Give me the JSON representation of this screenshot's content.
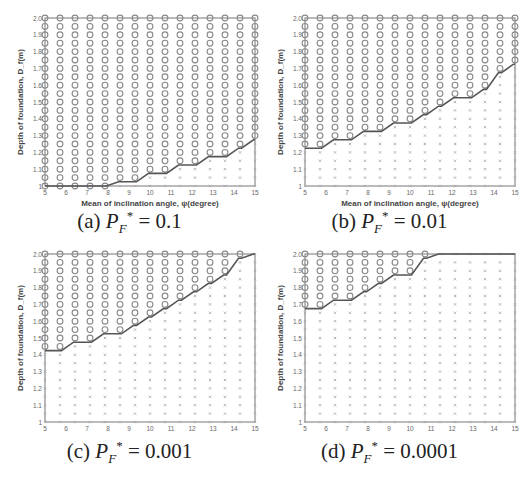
{
  "figure": {
    "xlabel": "Mean of inclination angle, ψ(degree)",
    "ylabel": "Depth of foundation, D_f(m)",
    "x_ticks": [
      "5",
      "6",
      "7",
      "8",
      "9",
      "10",
      "11",
      "12",
      "13",
      "14",
      "15"
    ],
    "y_ticks": [
      "1",
      "1.1",
      "1.2",
      "1.3",
      "1.4",
      "1.5",
      "1.6",
      "1.7",
      "1.8",
      "1.9",
      "2.0"
    ],
    "legend_markers": {
      "feasible": "o",
      "infeasible": "x"
    }
  },
  "chart_data": [
    {
      "type": "scatter",
      "panel": "a",
      "caption_prefix": "(a)",
      "caption_value": "0.1",
      "title": "(a) P_F* = 0.1",
      "xlabel": "Mean of inclination angle, ψ(degree)",
      "ylabel": "Depth of foundation, D_f(m)",
      "xlim": [
        5,
        15
      ],
      "ylim": [
        1.0,
        2.0
      ],
      "grid_x_count": 15,
      "grid_y_step": 0.05,
      "boundary_row_index": [
        0,
        0,
        0,
        0,
        0,
        1,
        1,
        2,
        2,
        3,
        3,
        4,
        4,
        5,
        6
      ],
      "description": "Circles mark feasible designs above the stepped boundary; crosses mark infeasible ones below."
    },
    {
      "type": "scatter",
      "panel": "b",
      "caption_prefix": "(b)",
      "caption_value": "0.01",
      "title": "(b) P_F* = 0.01",
      "xlabel": "Mean of inclination angle, ψ(degree)",
      "ylabel": "Depth of foundation, D_f(m)",
      "xlim": [
        5,
        15
      ],
      "ylim": [
        1.0,
        2.0
      ],
      "grid_x_count": 15,
      "grid_y_step": 0.05,
      "boundary_row_index": [
        5,
        5,
        6,
        6,
        7,
        7,
        8,
        8,
        9,
        10,
        11,
        11,
        12,
        14,
        15
      ]
    },
    {
      "type": "scatter",
      "panel": "c",
      "caption_prefix": "(c)",
      "caption_value": "0.001",
      "title": "(c) P_F* = 0.001",
      "xlabel": "Mean of inclination angle, ψ(degree)",
      "ylabel": "Depth of foundation, D_f(m)",
      "xlim": [
        5,
        15
      ],
      "ylim": [
        1.0,
        2.0
      ],
      "grid_x_count": 15,
      "grid_y_step": 0.05,
      "boundary_row_index": [
        9,
        9,
        10,
        10,
        11,
        11,
        12,
        13,
        14,
        15,
        16,
        17,
        18,
        20,
        21
      ]
    },
    {
      "type": "scatter",
      "panel": "d",
      "caption_prefix": "(d)",
      "caption_value": "0.0001",
      "title": "(d) P_F* = 0.0001",
      "xlabel": "Mean of inclination angle, ψ(degree)",
      "ylabel": "Depth of foundation, D_f(m)",
      "xlim": [
        5,
        15
      ],
      "ylim": [
        1.0,
        2.0
      ],
      "grid_x_count": 15,
      "grid_y_step": 0.05,
      "boundary_row_index": [
        14,
        14,
        15,
        15,
        16,
        17,
        18,
        18,
        20,
        21,
        21,
        21,
        21,
        21,
        21
      ]
    }
  ]
}
